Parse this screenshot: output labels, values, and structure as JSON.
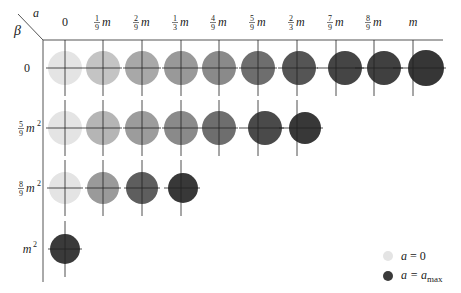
{
  "axes": {
    "corner_alpha_label": "a",
    "corner_beta_label": "β",
    "column_headers": [
      {
        "num": "",
        "den": "",
        "sym": "0"
      },
      {
        "num": "1",
        "den": "9",
        "sym": "m"
      },
      {
        "num": "2",
        "den": "9",
        "sym": "m"
      },
      {
        "num": "1",
        "den": "3",
        "sym": "m"
      },
      {
        "num": "4",
        "den": "9",
        "sym": "m"
      },
      {
        "num": "5",
        "den": "9",
        "sym": "m"
      },
      {
        "num": "2",
        "den": "3",
        "sym": "m"
      },
      {
        "num": "7",
        "den": "9",
        "sym": "m"
      },
      {
        "num": "8",
        "den": "9",
        "sym": "m"
      },
      {
        "num": "",
        "den": "",
        "sym": "m"
      }
    ],
    "row_headers": [
      {
        "num": "",
        "den": "",
        "sym": "0",
        "sup": ""
      },
      {
        "num": "5",
        "den": "9",
        "sym": "m",
        "sup": "2"
      },
      {
        "num": "8",
        "den": "9",
        "sym": "m",
        "sup": "2"
      },
      {
        "num": "",
        "den": "",
        "sym": "m",
        "sup": "2"
      }
    ]
  },
  "layout": {
    "col_x": [
      65,
      103,
      142,
      181,
      219,
      258,
      297,
      336,
      374,
      413
    ],
    "row_y": [
      68,
      128,
      188,
      249
    ],
    "header_y": 26,
    "row_label_x": 27,
    "top_rule_y": 40,
    "left_rule_x": 43,
    "radius": 17
  },
  "grid": [
    {
      "row": 0,
      "cells": [
        {
          "col": 0,
          "shade": "#e4e4e4",
          "dx": 0,
          "rx": 17
        },
        {
          "col": 1,
          "shade": "#c4c4c4",
          "dx": 0,
          "rx": 17
        },
        {
          "col": 2,
          "shade": "#a8a8a8",
          "dx": 0,
          "rx": 17
        },
        {
          "col": 3,
          "shade": "#999999",
          "dx": 0,
          "rx": 17
        },
        {
          "col": 4,
          "shade": "#8a8a8a",
          "dx": 0,
          "rx": 17
        },
        {
          "col": 5,
          "shade": "#6e6e6e",
          "dx": 0,
          "rx": 17
        },
        {
          "col": 6,
          "shade": "#555555",
          "dx": 2,
          "rx": 17
        },
        {
          "col": 7,
          "shade": "#454545",
          "dx": 9,
          "rx": 17
        },
        {
          "col": 8,
          "shade": "#404040",
          "dx": 10,
          "rx": 17
        },
        {
          "col": 9,
          "shade": "#363636",
          "dx": 13,
          "rx": 18
        }
      ]
    },
    {
      "row": 1,
      "cells": [
        {
          "col": 0,
          "shade": "#e4e4e4",
          "dx": 0,
          "rx": 17
        },
        {
          "col": 1,
          "shade": "#b5b5b5",
          "dx": 0,
          "rx": 17
        },
        {
          "col": 2,
          "shade": "#9c9c9c",
          "dx": 0,
          "rx": 17
        },
        {
          "col": 3,
          "shade": "#8a8a8a",
          "dx": 0,
          "rx": 17
        },
        {
          "col": 4,
          "shade": "#6e6e6e",
          "dx": 0,
          "rx": 17
        },
        {
          "col": 5,
          "shade": "#4a4a4a",
          "dx": 7,
          "rx": 17
        },
        {
          "col": 6,
          "shade": "#383838",
          "dx": 8,
          "rx": 16
        }
      ]
    },
    {
      "row": 2,
      "cells": [
        {
          "col": 0,
          "shade": "#e4e4e4",
          "dx": 0,
          "rx": 16
        },
        {
          "col": 1,
          "shade": "#9a9a9a",
          "dx": 0,
          "rx": 16
        },
        {
          "col": 2,
          "shade": "#5e5e5e",
          "dx": 0,
          "rx": 16
        },
        {
          "col": 3,
          "shade": "#383838",
          "dx": 2,
          "rx": 15
        }
      ]
    },
    {
      "row": 3,
      "cells": [
        {
          "col": 0,
          "shade": "#3a3a3a",
          "dx": 0,
          "rx": 15
        }
      ]
    }
  ],
  "legend": {
    "items": [
      {
        "color": "#e4e4e4",
        "label_var": "a",
        "label_eq": " = 0",
        "label_sub": ""
      },
      {
        "color": "#3a3a3a",
        "label_var": "a",
        "label_eq": " = a",
        "label_sub": "max"
      }
    ]
  },
  "colors": {
    "rule": "#555555",
    "crosshair": "#222222"
  }
}
